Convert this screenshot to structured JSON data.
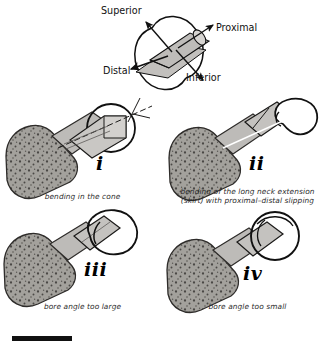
{
  "figure": {
    "background_color": "#ffffff",
    "ink_color": "#1a1a1a",
    "bone_fill": "#b9b7b4",
    "bone_cancellous_fill": "#96948f",
    "implant_fill": "#c8c6c3",
    "head_fill": "#ffffff"
  },
  "axis_key": {
    "name": "anatomical-orientation-key",
    "labels": {
      "superior": "Superior",
      "proximal": "Proximal",
      "distal": "Distal",
      "inferior": "Inferior"
    }
  },
  "panels": [
    {
      "numeral": "i",
      "caption_lines": [
        "bending in the cone"
      ],
      "name": "panel-i"
    },
    {
      "numeral": "ii",
      "caption_lines": [
        "bending of the long neck extension",
        "(skirt) with proximal–distal slipping"
      ],
      "name": "panel-ii"
    },
    {
      "numeral": "iii",
      "caption_lines": [
        "bore angle too large"
      ],
      "name": "panel-iii"
    },
    {
      "numeral": "iv",
      "caption_lines": [
        "bore angle too small"
      ],
      "name": "panel-iv"
    }
  ],
  "scale_bar": {
    "name": "scale-bar",
    "label": ""
  }
}
